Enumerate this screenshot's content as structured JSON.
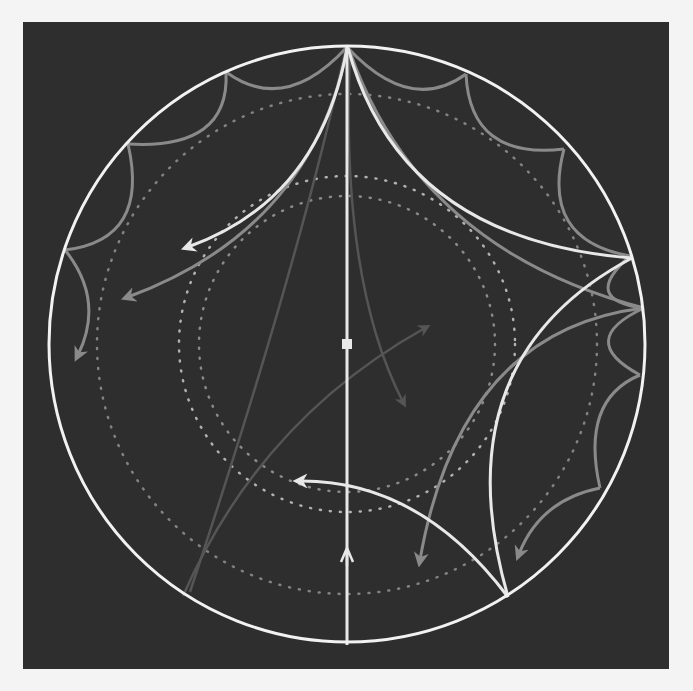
{
  "diagram": {
    "background_page": "#f4f4f4",
    "panel_color": "#2e2e2e",
    "boundary_color": "#f2f2f2",
    "geodesic_bright_color": "#e8e8e8",
    "geodesic_gray_color": "#8a8a8a",
    "geodesic_faint_color": "#555555",
    "dotted_color": "#c8c8c8",
    "disk": {
      "cx": 347,
      "cy": 344,
      "r": 298
    },
    "center_marker": {
      "x": 347,
      "y": 344,
      "label": "origin"
    },
    "elements": [
      "boundary-circle",
      "vertical-diameter",
      "bright-geodesic-arrows",
      "gray-tiling-arcs",
      "gray-geodesic-arrows",
      "dotted-concentric-circles",
      "faint-geodesics"
    ]
  }
}
